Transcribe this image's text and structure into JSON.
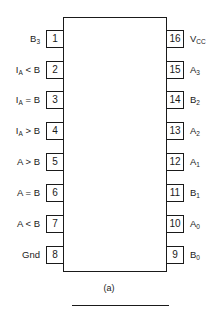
{
  "diagram": {
    "type": "ic-pinout",
    "caption": "(a)",
    "left_pins": [
      {
        "number": "1",
        "label": "B",
        "sub": "3",
        "suffix": ""
      },
      {
        "number": "2",
        "label": "I",
        "sub": "A",
        "suffix": " < B"
      },
      {
        "number": "3",
        "label": "I",
        "sub": "A",
        "suffix": " = B"
      },
      {
        "number": "4",
        "label": "I",
        "sub": "A",
        "suffix": " > B"
      },
      {
        "number": "5",
        "label": "A > B",
        "sub": "",
        "suffix": ""
      },
      {
        "number": "6",
        "label": "A = B",
        "sub": "",
        "suffix": ""
      },
      {
        "number": "7",
        "label": "A < B",
        "sub": "",
        "suffix": ""
      },
      {
        "number": "8",
        "label": "Gnd",
        "sub": "",
        "suffix": ""
      }
    ],
    "right_pins": [
      {
        "number": "16",
        "label": "V",
        "sub": "CC",
        "suffix": ""
      },
      {
        "number": "15",
        "label": "A",
        "sub": "3",
        "suffix": ""
      },
      {
        "number": "14",
        "label": "B",
        "sub": "2",
        "suffix": ""
      },
      {
        "number": "13",
        "label": "A",
        "sub": "2",
        "suffix": ""
      },
      {
        "number": "12",
        "label": "A",
        "sub": "1",
        "suffix": ""
      },
      {
        "number": "11",
        "label": "B",
        "sub": "1",
        "suffix": ""
      },
      {
        "number": "10",
        "label": "A",
        "sub": "0",
        "suffix": ""
      },
      {
        "number": "9",
        "label": "B",
        "sub": "0",
        "suffix": ""
      }
    ]
  }
}
